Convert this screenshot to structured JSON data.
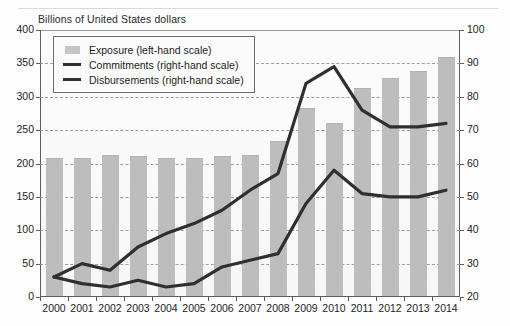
{
  "chart_data": {
    "type": "bar",
    "title": "",
    "subtitle": "",
    "unit_label": "Billions of United States dollars",
    "xlabel": "",
    "ylabel": "",
    "grid": true,
    "legend_position": "top-left",
    "categories": [
      "2000",
      "2001",
      "2002",
      "2003",
      "2004",
      "2005",
      "2006",
      "2007",
      "2008",
      "2009",
      "2010",
      "2011",
      "2012",
      "2013",
      "2014"
    ],
    "left_axis": {
      "label": "Billions of United States dollars",
      "ticks": [
        0,
        50,
        100,
        150,
        200,
        250,
        300,
        350,
        400
      ],
      "ylim": [
        0,
        400
      ],
      "scale_name": "left-hand scale"
    },
    "right_axis": {
      "ticks": [
        20,
        30,
        40,
        50,
        60,
        70,
        80,
        90,
        100
      ],
      "ylim": [
        20,
        100
      ],
      "scale_name": "right-hand scale"
    },
    "series": [
      {
        "name": "Exposure (left-hand scale)",
        "short_name": "Exposure",
        "type": "bar",
        "axis": "left",
        "color": "#bdbdbd",
        "values": [
          205,
          205,
          210,
          208,
          205,
          205,
          208,
          210,
          230,
          280,
          258,
          310,
          325,
          335,
          357
        ]
      },
      {
        "name": "Commitments (right-hand scale)",
        "short_name": "Commitments",
        "type": "line",
        "axis": "right",
        "color": "#2f2f2f",
        "values": [
          26,
          30,
          28,
          35,
          39,
          42,
          46,
          52,
          57,
          84,
          89,
          76,
          71,
          71,
          72
        ]
      },
      {
        "name": "Disbursements (right-hand scale)",
        "short_name": "Disbursements",
        "type": "line",
        "axis": "right",
        "color": "#2f2f2f",
        "values": [
          26,
          24,
          23,
          25,
          23,
          24,
          29,
          31,
          33,
          48,
          58,
          51,
          50,
          50,
          52
        ]
      }
    ]
  },
  "legend": {
    "entries": [
      {
        "label": "Exposure (left-hand scale)",
        "marker": "bar-swatch"
      },
      {
        "label": "Commitments (right-hand scale)",
        "marker": "line-swatch"
      },
      {
        "label": "Disbursements (right-hand scale)",
        "marker": "line-swatch"
      }
    ]
  },
  "colors": {
    "bar": "#bdbdbd",
    "line": "#2f2f2f",
    "axis": "#5d5d5d",
    "grid": "#8f8f8f",
    "plot_bg": "#f8f8f8"
  }
}
